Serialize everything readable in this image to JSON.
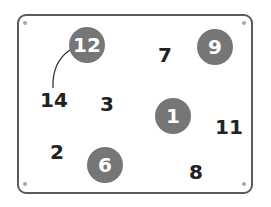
{
  "board": {
    "border_color": "#5a5a5a",
    "circle_color": "#767676",
    "numbers": [
      {
        "value": "12",
        "x": 87,
        "y": 45,
        "circled": true
      },
      {
        "value": "7",
        "x": 165,
        "y": 55,
        "circled": false
      },
      {
        "value": "9",
        "x": 215,
        "y": 47,
        "circled": true
      },
      {
        "value": "14",
        "x": 54,
        "y": 100,
        "circled": false
      },
      {
        "value": "3",
        "x": 107,
        "y": 104,
        "circled": false
      },
      {
        "value": "1",
        "x": 173,
        "y": 116,
        "circled": true
      },
      {
        "value": "11",
        "x": 229,
        "y": 127,
        "circled": false
      },
      {
        "value": "2",
        "x": 57,
        "y": 152,
        "circled": false
      },
      {
        "value": "6",
        "x": 105,
        "y": 165,
        "circled": true
      },
      {
        "value": "8",
        "x": 196,
        "y": 172,
        "circled": false
      }
    ],
    "connections": [
      {
        "from": "12",
        "to": "14"
      }
    ]
  }
}
